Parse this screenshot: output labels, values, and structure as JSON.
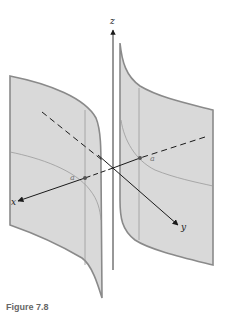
{
  "figure": {
    "axis_labels": {
      "x": "x",
      "y": "y",
      "z": "z"
    },
    "point_labels": {
      "left": "a",
      "right": "a"
    },
    "caption": "Figure 7.8",
    "colors": {
      "surface_fill": "#d9d9d9",
      "surface_edge": "#8a8a8a",
      "inner_curve": "#a0a0a0",
      "axis": "#1a1a1a"
    }
  }
}
